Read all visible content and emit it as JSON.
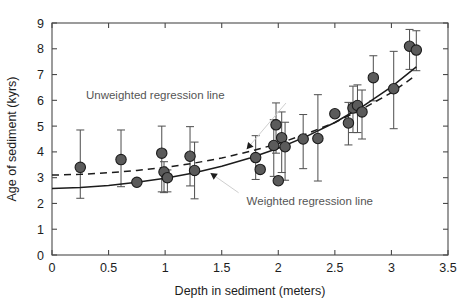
{
  "chart_data": {
    "type": "scatter",
    "title": "",
    "xlabel": "Depth in sediment (meters)",
    "ylabel": "Age of sediment (kyrs)",
    "xlim": [
      0,
      3.5
    ],
    "ylim": [
      0,
      9
    ],
    "xticks": [
      0,
      0.5,
      1,
      1.5,
      2,
      2.5,
      3,
      3.5
    ],
    "xtick_labels": [
      "0",
      "0.5",
      "1",
      "1.5",
      "2",
      "2.5",
      "3",
      "3.5"
    ],
    "yticks": [
      0,
      1,
      2,
      3,
      4,
      5,
      6,
      7,
      8,
      9
    ],
    "ytick_labels": [
      "0",
      "1",
      "2",
      "3",
      "4",
      "5",
      "6",
      "7",
      "8",
      "9"
    ],
    "grid": false,
    "legend": "none",
    "marker_color": "#5b5b5b",
    "marker_edge_color": "#1c1c1c",
    "errorbar_color": "#555555",
    "points": [
      {
        "x": 0.25,
        "y": 3.4,
        "yerr_low": 1.2,
        "yerr_high": 1.45
      },
      {
        "x": 0.61,
        "y": 3.7,
        "yerr_low": 1.05,
        "yerr_high": 1.15
      },
      {
        "x": 0.75,
        "y": 2.82,
        "yerr_low": 0.0,
        "yerr_high": 0.0
      },
      {
        "x": 0.97,
        "y": 3.95,
        "yerr_low": 1.5,
        "yerr_high": 1.05
      },
      {
        "x": 0.99,
        "y": 3.22,
        "yerr_low": 0.8,
        "yerr_high": 0.4
      },
      {
        "x": 1.02,
        "y": 3.0,
        "yerr_low": 0.55,
        "yerr_high": 0.3
      },
      {
        "x": 1.22,
        "y": 3.83,
        "yerr_low": 1.15,
        "yerr_high": 1.15
      },
      {
        "x": 1.26,
        "y": 3.28,
        "yerr_low": 1.1,
        "yerr_high": 1.1
      },
      {
        "x": 1.8,
        "y": 3.78,
        "yerr_low": 0.85,
        "yerr_high": 0.85
      },
      {
        "x": 1.84,
        "y": 3.32,
        "yerr_low": 0.0,
        "yerr_high": 0.0
      },
      {
        "x": 1.96,
        "y": 4.25,
        "yerr_low": 1.2,
        "yerr_high": 1.0
      },
      {
        "x": 1.98,
        "y": 5.05,
        "yerr_low": 1.1,
        "yerr_high": 0.85
      },
      {
        "x": 2.0,
        "y": 2.88,
        "yerr_low": 0.0,
        "yerr_high": 0.0
      },
      {
        "x": 2.03,
        "y": 4.55,
        "yerr_low": 1.35,
        "yerr_high": 1.0
      },
      {
        "x": 2.06,
        "y": 4.2,
        "yerr_low": 1.3,
        "yerr_high": 0.95
      },
      {
        "x": 2.22,
        "y": 4.5,
        "yerr_low": 1.15,
        "yerr_high": 0.95
      },
      {
        "x": 2.35,
        "y": 4.52,
        "yerr_low": 1.65,
        "yerr_high": 1.7
      },
      {
        "x": 2.5,
        "y": 5.48,
        "yerr_low": 0.0,
        "yerr_high": 0.0
      },
      {
        "x": 2.62,
        "y": 5.12,
        "yerr_low": 0.85,
        "yerr_high": 0.8
      },
      {
        "x": 2.66,
        "y": 5.7,
        "yerr_low": 0.95,
        "yerr_high": 0.85
      },
      {
        "x": 2.7,
        "y": 5.8,
        "yerr_low": 1.05,
        "yerr_high": 0.8
      },
      {
        "x": 2.74,
        "y": 5.55,
        "yerr_low": 1.05,
        "yerr_high": 0.85
      },
      {
        "x": 2.84,
        "y": 6.88,
        "yerr_low": 0.9,
        "yerr_high": 0.85
      },
      {
        "x": 3.02,
        "y": 6.45,
        "yerr_low": 1.55,
        "yerr_high": 1.45
      },
      {
        "x": 3.16,
        "y": 8.1,
        "yerr_low": 0.9,
        "yerr_high": 0.65
      },
      {
        "x": 3.22,
        "y": 7.95,
        "yerr_low": 0.8,
        "yerr_high": 0.75
      }
    ],
    "series": [
      {
        "name": "Weighted regression line",
        "style": "solid",
        "annotation": "Weighted regression line",
        "curve": [
          {
            "x": 0.0,
            "y": 2.58
          },
          {
            "x": 0.25,
            "y": 2.62
          },
          {
            "x": 0.5,
            "y": 2.7
          },
          {
            "x": 0.75,
            "y": 2.82
          },
          {
            "x": 1.0,
            "y": 2.98
          },
          {
            "x": 1.25,
            "y": 3.18
          },
          {
            "x": 1.5,
            "y": 3.44
          },
          {
            "x": 1.75,
            "y": 3.76
          },
          {
            "x": 2.0,
            "y": 4.14
          },
          {
            "x": 2.25,
            "y": 4.6
          },
          {
            "x": 2.5,
            "y": 5.14
          },
          {
            "x": 2.75,
            "y": 5.78
          },
          {
            "x": 3.0,
            "y": 6.52
          },
          {
            "x": 3.22,
            "y": 7.3
          }
        ]
      },
      {
        "name": "Unweighted regression line",
        "style": "dashed",
        "annotation": "Unweighted regression line",
        "curve": [
          {
            "x": 0.0,
            "y": 3.1
          },
          {
            "x": 0.25,
            "y": 3.13
          },
          {
            "x": 0.5,
            "y": 3.19
          },
          {
            "x": 0.75,
            "y": 3.28
          },
          {
            "x": 1.0,
            "y": 3.4
          },
          {
            "x": 1.25,
            "y": 3.56
          },
          {
            "x": 1.5,
            "y": 3.76
          },
          {
            "x": 1.75,
            "y": 4.02
          },
          {
            "x": 2.0,
            "y": 4.32
          },
          {
            "x": 2.25,
            "y": 4.7
          },
          {
            "x": 2.5,
            "y": 5.14
          },
          {
            "x": 2.75,
            "y": 5.68
          },
          {
            "x": 3.0,
            "y": 6.3
          },
          {
            "x": 3.22,
            "y": 6.98
          }
        ]
      }
    ],
    "annotations": [
      {
        "id": "unweighted",
        "text": "Unweighted regression line",
        "text_x": 0.3,
        "text_y": 6.05,
        "arrow_to_x": 1.72,
        "arrow_to_y": 4.1
      },
      {
        "id": "weighted",
        "text": "Weighted regression line",
        "text_x": 1.72,
        "text_y": 1.95,
        "arrow_to_x": 1.4,
        "arrow_to_y": 3.18
      }
    ]
  }
}
